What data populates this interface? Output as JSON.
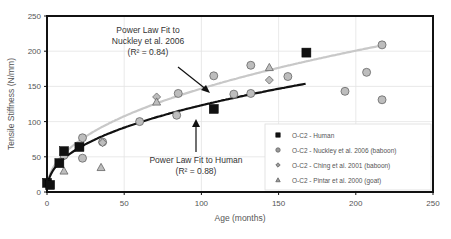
{
  "chart_data": {
    "type": "scatter",
    "title": "",
    "xlabel": "Age (months)",
    "ylabel": "Tensile Stiffness (N/mm)",
    "xlim": [
      0,
      250
    ],
    "ylim": [
      0,
      250
    ],
    "xticks": [
      0,
      50,
      100,
      150,
      200,
      250
    ],
    "yticks": [
      0,
      50,
      100,
      150,
      200,
      250
    ],
    "grid": true,
    "legend_position": "lower right",
    "series": [
      {
        "name": "O-C2 - Human",
        "marker": "square",
        "color": "#111111",
        "points": [
          [
            0,
            13
          ],
          [
            2,
            10
          ],
          [
            8,
            41
          ],
          [
            11,
            58
          ],
          [
            21,
            64
          ],
          [
            108,
            118
          ],
          [
            168,
            198
          ]
        ]
      },
      {
        "name": "O-C2 - Nuckley et al. 2006 (baboon)",
        "marker": "circle",
        "color": "#bdbdbd",
        "points": [
          [
            11,
            52
          ],
          [
            23,
            77
          ],
          [
            23,
            48
          ],
          [
            36,
            71
          ],
          [
            60,
            100
          ],
          [
            84,
            109
          ],
          [
            85,
            140
          ],
          [
            108,
            165
          ],
          [
            121,
            139
          ],
          [
            132,
            140
          ],
          [
            132,
            180
          ],
          [
            156,
            164
          ],
          [
            193,
            143
          ],
          [
            207,
            170
          ],
          [
            217,
            209
          ],
          [
            217,
            131
          ]
        ]
      },
      {
        "name": "O-C2 - Ching et al. 2001 (baboon)",
        "marker": "diamond",
        "color": "#bdbdbd",
        "points": [
          [
            36,
            70
          ],
          [
            71,
            135
          ],
          [
            144,
            159
          ]
        ]
      },
      {
        "name": "O-C2 - Pintar et al. 2000 (goat)",
        "marker": "triangle",
        "color": "#bdbdbd",
        "points": [
          [
            11,
            30
          ],
          [
            35,
            35
          ],
          [
            71,
            128
          ],
          [
            144,
            177
          ]
        ]
      }
    ],
    "fits": [
      {
        "name": "Power Law Fit to Nuckley et al. 2006",
        "r2": 0.84,
        "color": "#c8c8c8",
        "x_range": [
          0,
          217
        ],
        "a": 18.5,
        "b": 0.45
      },
      {
        "name": "Power Law Fit to Human",
        "r2": 0.88,
        "color": "#111111",
        "x_range": [
          0,
          168
        ],
        "a": 17.0,
        "b": 0.43
      }
    ],
    "annotations": [
      {
        "line1": "Power Law Fit to",
        "line2": "Nuckley et al. 2006",
        "line3": "(R² = 0.84)"
      },
      {
        "line1": "Power Law Fit to Human",
        "line2": "(R² = 0.88)"
      }
    ]
  }
}
